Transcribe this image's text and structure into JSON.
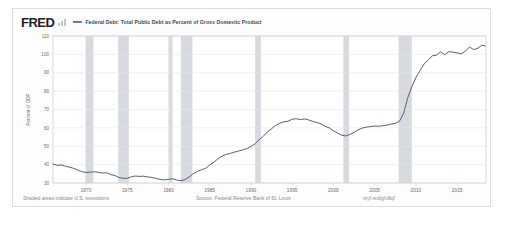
{
  "header": {
    "logo": "FRED",
    "logo_mark": "bar-chart-mark",
    "series_label": "Federal Debt: Total Public Debt as Percent of Gross Domestic Product"
  },
  "footer": {
    "left": "Shaded areas indicate U.S. recessions",
    "center": "Source: Federal Reserve Bank of St. Louis",
    "right": "myf.red/g/n8qf"
  },
  "colors": {
    "line": "#53606b",
    "recession_band": "#d7dade",
    "grid": "#e8e8e8",
    "frame": "#dddddd",
    "text": "#6b6b6b",
    "title_text": "#3b4a56"
  },
  "chart_data": {
    "type": "line",
    "title": "Federal Debt: Total Public Debt as Percent of Gross Domestic Product",
    "xlabel": "",
    "ylabel": "Percent of GDP",
    "ylim": [
      30,
      110
    ],
    "xlim": [
      1966,
      2018.5
    ],
    "yticks": [
      30,
      40,
      50,
      60,
      70,
      80,
      90,
      100,
      110
    ],
    "xticks": [
      1970,
      1975,
      1980,
      1985,
      1990,
      1995,
      2000,
      2005,
      2010,
      2015
    ],
    "grid": true,
    "legend_position": "top",
    "series": [
      {
        "name": "Federal Debt: Total Public Debt as Percent of Gross Domestic Product",
        "color": "#53606b",
        "points": [
          [
            1966.0,
            40.3
          ],
          [
            1966.5,
            39.6
          ],
          [
            1967.0,
            39.8
          ],
          [
            1967.5,
            39.2
          ],
          [
            1968.0,
            38.6
          ],
          [
            1968.5,
            38.0
          ],
          [
            1969.0,
            37.0
          ],
          [
            1969.5,
            36.2
          ],
          [
            1970.0,
            35.7
          ],
          [
            1970.5,
            35.9
          ],
          [
            1971.0,
            36.1
          ],
          [
            1971.5,
            35.8
          ],
          [
            1972.0,
            35.4
          ],
          [
            1972.5,
            35.6
          ],
          [
            1973.0,
            34.6
          ],
          [
            1973.5,
            34.1
          ],
          [
            1974.0,
            33.0
          ],
          [
            1974.5,
            32.6
          ],
          [
            1975.0,
            32.5
          ],
          [
            1975.5,
            33.4
          ],
          [
            1976.0,
            33.8
          ],
          [
            1976.5,
            33.6
          ],
          [
            1977.0,
            33.7
          ],
          [
            1977.5,
            33.3
          ],
          [
            1978.0,
            33.0
          ],
          [
            1978.5,
            32.5
          ],
          [
            1979.0,
            31.9
          ],
          [
            1979.5,
            31.7
          ],
          [
            1980.0,
            32.0
          ],
          [
            1980.5,
            32.3
          ],
          [
            1981.0,
            31.6
          ],
          [
            1981.5,
            31.2
          ],
          [
            1982.0,
            31.8
          ],
          [
            1982.5,
            33.3
          ],
          [
            1983.0,
            35.1
          ],
          [
            1983.5,
            36.3
          ],
          [
            1984.0,
            37.2
          ],
          [
            1984.5,
            38.0
          ],
          [
            1985.0,
            39.8
          ],
          [
            1985.5,
            41.3
          ],
          [
            1986.0,
            43.2
          ],
          [
            1986.5,
            44.6
          ],
          [
            1987.0,
            45.6
          ],
          [
            1987.5,
            46.1
          ],
          [
            1988.0,
            46.8
          ],
          [
            1988.5,
            47.4
          ],
          [
            1989.0,
            48.0
          ],
          [
            1989.5,
            48.7
          ],
          [
            1990.0,
            49.9
          ],
          [
            1990.5,
            51.3
          ],
          [
            1991.0,
            53.6
          ],
          [
            1991.5,
            55.4
          ],
          [
            1992.0,
            57.8
          ],
          [
            1992.5,
            59.5
          ],
          [
            1993.0,
            61.4
          ],
          [
            1993.5,
            62.5
          ],
          [
            1994.0,
            63.3
          ],
          [
            1994.5,
            63.6
          ],
          [
            1995.0,
            64.7
          ],
          [
            1995.5,
            65.0
          ],
          [
            1996.0,
            64.5
          ],
          [
            1996.5,
            64.9
          ],
          [
            1997.0,
            64.3
          ],
          [
            1997.5,
            63.5
          ],
          [
            1998.0,
            62.9
          ],
          [
            1998.5,
            62.2
          ],
          [
            1999.0,
            60.8
          ],
          [
            1999.5,
            60.0
          ],
          [
            2000.0,
            58.4
          ],
          [
            2000.5,
            57.2
          ],
          [
            2001.0,
            56.0
          ],
          [
            2001.5,
            55.6
          ],
          [
            2002.0,
            56.4
          ],
          [
            2002.5,
            57.5
          ],
          [
            2003.0,
            58.9
          ],
          [
            2003.5,
            59.9
          ],
          [
            2004.0,
            60.4
          ],
          [
            2004.5,
            60.7
          ],
          [
            2005.0,
            61.0
          ],
          [
            2005.5,
            60.9
          ],
          [
            2006.0,
            61.2
          ],
          [
            2006.5,
            61.5
          ],
          [
            2007.0,
            62.1
          ],
          [
            2007.5,
            62.4
          ],
          [
            2008.0,
            63.6
          ],
          [
            2008.5,
            67.7
          ],
          [
            2009.0,
            76.2
          ],
          [
            2009.5,
            82.4
          ],
          [
            2010.0,
            87.3
          ],
          [
            2010.5,
            91.2
          ],
          [
            2011.0,
            94.8
          ],
          [
            2011.5,
            97.0
          ],
          [
            2012.0,
            99.2
          ],
          [
            2012.5,
            99.6
          ],
          [
            2013.0,
            101.4
          ],
          [
            2013.5,
            99.8
          ],
          [
            2014.0,
            101.5
          ],
          [
            2014.5,
            101.2
          ],
          [
            2015.0,
            100.8
          ],
          [
            2015.5,
            100.3
          ],
          [
            2016.0,
            101.8
          ],
          [
            2016.5,
            104.0
          ],
          [
            2017.0,
            102.6
          ],
          [
            2017.5,
            103.3
          ],
          [
            2018.0,
            105.0
          ],
          [
            2018.4,
            104.6
          ]
        ]
      }
    ],
    "recession_bands": [
      {
        "start": 1969.95,
        "end": 1970.9
      },
      {
        "start": 1973.9,
        "end": 1975.2
      },
      {
        "start": 1980.0,
        "end": 1980.5
      },
      {
        "start": 1981.5,
        "end": 1982.9
      },
      {
        "start": 1990.5,
        "end": 1991.2
      },
      {
        "start": 2001.2,
        "end": 2001.9
      },
      {
        "start": 2007.9,
        "end": 2009.5
      }
    ]
  }
}
